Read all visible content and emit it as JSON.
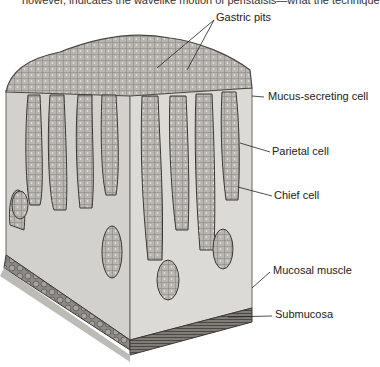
{
  "caption_fragment": "however, indicates the wavelike motion of peristalsis—what the technique",
  "figure": {
    "labels": [
      {
        "id": "gastric-pits",
        "text": "Gastric pits"
      },
      {
        "id": "mucus-secreting-cell",
        "text": "Mucus-secreting cell"
      },
      {
        "id": "parietal-cell",
        "text": "Parietal cell"
      },
      {
        "id": "chief-cell",
        "text": "Chief cell"
      },
      {
        "id": "mucosal-muscle",
        "text": "Mucosal muscle"
      },
      {
        "id": "submucosa",
        "text": "Submucosa"
      }
    ]
  },
  "colors": {
    "tissue": "#d8d6d2",
    "tissue_dark": "#a9a6a1",
    "cells": "#8c8984",
    "outline": "#3a3836",
    "muscle": "#5e5a56",
    "text": "#222222"
  }
}
